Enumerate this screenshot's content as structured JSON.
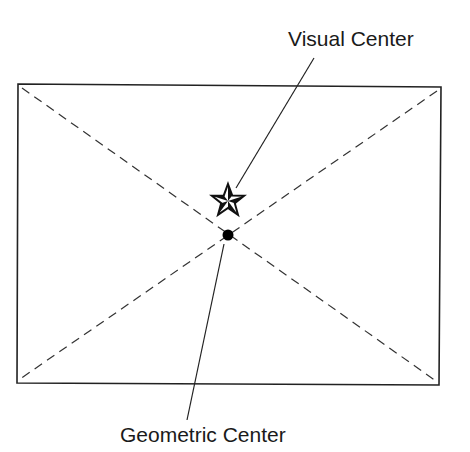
{
  "diagram": {
    "labels": {
      "visual_center": "Visual Center",
      "geometric_center": "Geometric Center"
    },
    "colors": {
      "stroke": "#222222",
      "background": "#ffffff"
    },
    "markers": {
      "visual_center": "star-icon",
      "geometric_center": "dot-icon"
    }
  }
}
